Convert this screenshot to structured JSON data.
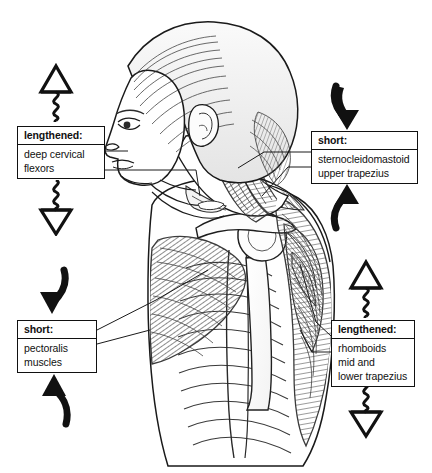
{
  "diagram": {
    "background_color": "#ffffff",
    "ink_color": "#111111",
    "figure": {
      "description": "Pen and ink lateral view illustration of a woman's head, neck and upper torso facing left, showing forward head posture with underlying musculature, ribcage, scapula, clavicle and humerus",
      "view": "left lateral profile"
    }
  },
  "boxes": {
    "top_left": {
      "header": "lengthened:",
      "lines": [
        "deep cervical",
        "flexors"
      ],
      "state": "lengthened",
      "symbol_above": "hollow-up-triangle-with-spring",
      "symbol_below": "spring-with-hollow-down-triangle"
    },
    "top_right": {
      "header": "short:",
      "lines": [
        "sternocleidomastoid",
        "upper trapezius"
      ],
      "state": "short",
      "symbol_above": "solid-curved-arrow-down",
      "symbol_below": "solid-curved-arrow-up"
    },
    "bottom_left": {
      "header": "short:",
      "lines": [
        "pectoralis",
        "muscles"
      ],
      "state": "short",
      "symbol_above": "solid-curved-arrow-down",
      "symbol_below": "solid-curved-arrow-up"
    },
    "bottom_right": {
      "header": "lengthened:",
      "lines": [
        "rhomboids",
        "mid and",
        "lower trapezius"
      ],
      "state": "lengthened",
      "symbol_above": "hollow-up-triangle-with-spring",
      "symbol_below": "spring-with-hollow-down-triangle"
    }
  }
}
